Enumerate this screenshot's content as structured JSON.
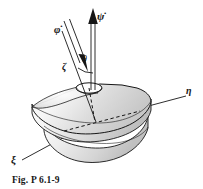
{
  "figure": {
    "caption": "Fig. P 6.1-9",
    "background_color": "#ffffff",
    "ink_color": "#161616",
    "body_fill_light": "#f2f2f2",
    "body_fill_mid": "#d8d8d8",
    "body_fill_dark": "#bdbdbd",
    "width_px": 203,
    "height_px": 189
  },
  "labels": {
    "phi_dot": "φ̇",
    "psi_dot": "ψ̇",
    "theta": "θ",
    "zeta": "ζ",
    "eta": "η",
    "xi": "ξ"
  },
  "diagram": {
    "elements": [
      {
        "name": "psi-dot-vector-arrow",
        "kind": "double-line-vector-arrow",
        "description": "vertical precession rate vector pointing up"
      },
      {
        "name": "phi-dot-vector-arrow",
        "kind": "double-line-vector-arrow",
        "description": "spin rate vector along body symmetry axis pointing down-right toward the top"
      },
      {
        "name": "zeta-axis-line",
        "kind": "line",
        "description": "body symmetry axis zeta through the top"
      },
      {
        "name": "theta-angle-arc",
        "kind": "arc",
        "description": "nutation angle between zeta axis and vertical"
      },
      {
        "name": "eta-axis-line",
        "kind": "line",
        "description": "body axis eta extending to upper right"
      },
      {
        "name": "xi-axis-line",
        "kind": "line",
        "description": "body axis xi extending to lower left"
      },
      {
        "name": "top-body",
        "kind": "shaded-solid",
        "description": "conical spinning top body with elliptical rim and small top cavity"
      },
      {
        "name": "vertical-dashed-axis",
        "kind": "dashed-line",
        "description": "vertical reference axis inside the body"
      },
      {
        "name": "horizontal-dashed-axis",
        "kind": "dashed-line",
        "description": "hidden eta axis segment inside the body"
      }
    ]
  }
}
